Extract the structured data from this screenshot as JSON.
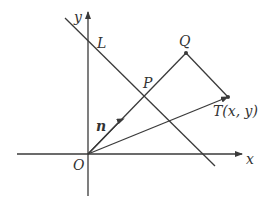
{
  "diagram": {
    "type": "coordinate-geometry",
    "axes": {
      "x_label": "x",
      "y_label": "y",
      "origin_label": "O"
    },
    "points": {
      "O": {
        "label": "O"
      },
      "L": {
        "label": "L"
      },
      "P": {
        "label": "P"
      },
      "Q": {
        "label": "Q"
      },
      "T": {
        "label": "T(x, y)"
      }
    },
    "vectors": {
      "n": {
        "label": "n"
      }
    },
    "colors": {
      "stroke": "#3a3a3a",
      "text": "#333333",
      "background": "#ffffff"
    }
  }
}
